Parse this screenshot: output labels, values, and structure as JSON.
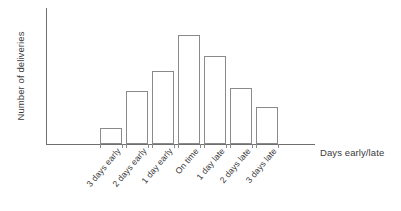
{
  "chart_data": {
    "type": "bar",
    "title": "",
    "subtitle": "",
    "xlabel": "Days early/late",
    "ylabel": "Number of deliveries",
    "categories": [
      "3 days early",
      "2 days early",
      "1 day early",
      "On time",
      "1 day late",
      "2 days late",
      "3 days late"
    ],
    "values": [
      12,
      39,
      54,
      80,
      65,
      41,
      27
    ],
    "series": [
      {
        "name": "Number of deliveries",
        "values": [
          12,
          39,
          54,
          80,
          65,
          41,
          27
        ]
      }
    ],
    "ylim": [
      0,
      100
    ],
    "grid": false,
    "legend": false,
    "legend_position": "none",
    "y_tick_labels": [],
    "x_tick_labels": [
      "3 days early",
      "2 days early",
      "1 day early",
      "On time",
      "1 day late",
      "2 days late",
      "3 days late"
    ],
    "annotations": [],
    "colors": {
      "bar_fill": "#ffffff",
      "bar_stroke": "#8a8a8a",
      "axis": "#6f6f6f",
      "text": "#3a3a3a",
      "background": "#ffffff"
    }
  },
  "axes": {
    "y_title": "Number of deliveries",
    "x_title": "Days early/late"
  }
}
